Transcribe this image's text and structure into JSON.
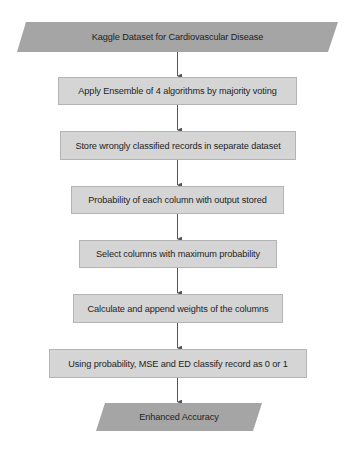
{
  "flowchart": {
    "colors": {
      "io_fill": "#a5a5a5",
      "process_fill": "#d5d5d5",
      "process_border": "#b4b4b4",
      "connector": "#555555",
      "text": "#1e1e1e"
    },
    "start": {
      "shape": "parallelogram",
      "label": "Kaggle Dataset for Cardiovascular Disease"
    },
    "steps": [
      {
        "shape": "rectangle",
        "label": "Apply Ensemble of 4 algorithms by majority voting"
      },
      {
        "shape": "rectangle",
        "label": "Store wrongly classified records in separate dataset"
      },
      {
        "shape": "rectangle",
        "label": "Probability of each column with output stored"
      },
      {
        "shape": "rectangle",
        "label": "Select columns with maximum probability"
      },
      {
        "shape": "rectangle",
        "label": "Calculate and append weights of the columns"
      },
      {
        "shape": "rectangle",
        "label": "Using probability, MSE and ED classify record as 0 or 1"
      }
    ],
    "end": {
      "shape": "parallelogram",
      "label": "Enhanced Accuracy"
    }
  }
}
